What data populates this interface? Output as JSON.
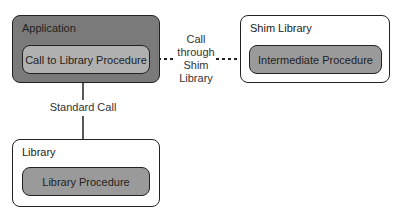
{
  "diagram": {
    "application": {
      "title": "Application",
      "procedure": "Call to Library Procedure"
    },
    "shim_library": {
      "title": "Shim Library",
      "procedure": "Intermediate Procedure"
    },
    "library": {
      "title": "Library",
      "procedure": "Library Procedure"
    },
    "edges": {
      "shim_call": {
        "line1": "Call",
        "line2": "through",
        "line3": "Shim",
        "line4": "Library",
        "style": "dotted"
      },
      "standard_call": {
        "label": "Standard Call",
        "style": "solid"
      }
    },
    "colors": {
      "application_fill": "#7a7a7a",
      "procedure_fill": "#9a9a9a",
      "border": "#222222"
    }
  }
}
